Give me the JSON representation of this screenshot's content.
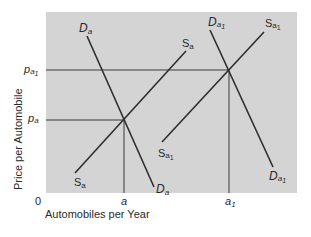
{
  "diagram": {
    "type": "supply-demand",
    "background_color": "#d4d4d4",
    "line_color": "#2e2e2e",
    "axes": {
      "x_label": "Automobiles per Year",
      "y_label": "Price per Automobile",
      "origin_label": "0",
      "x_ticks": [
        {
          "base": "a",
          "sub": ""
        },
        {
          "base": "a",
          "sub": "1"
        }
      ],
      "y_ticks": [
        {
          "base": "p",
          "sub": "a",
          "subsub": "1"
        },
        {
          "base": "p",
          "sub": "a",
          "subsub": ""
        }
      ]
    },
    "curves": {
      "demand_original": {
        "base": "D",
        "sub": "a",
        "subsub": ""
      },
      "supply_original": {
        "base": "S",
        "sub": "a",
        "subsub": ""
      },
      "demand_shifted": {
        "base": "D",
        "sub": "a",
        "subsub": "1"
      },
      "supply_shifted": {
        "base": "S",
        "sub": "a",
        "subsub": "1"
      }
    },
    "equilibria": [
      {
        "quantity": "a",
        "price": "p_a"
      },
      {
        "quantity": "a_1",
        "price": "p_a1"
      }
    ]
  }
}
